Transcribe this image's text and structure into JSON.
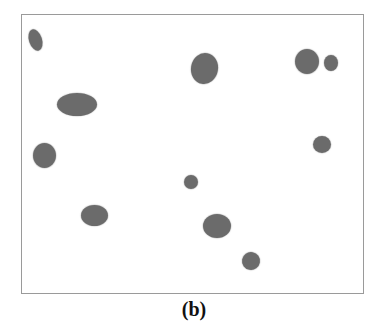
{
  "figure": {
    "caption": "(b)",
    "frame": {
      "x": 21,
      "y": 14,
      "width": 341,
      "height": 278,
      "border_color": "#9a9a9a"
    },
    "blob_color": "#6b6b6b",
    "blobs": [
      {
        "id": 1,
        "cx": 35,
        "cy": 40,
        "w": 13,
        "h": 22,
        "rotate": -18
      },
      {
        "id": 2,
        "cx": 77,
        "cy": 104,
        "w": 40,
        "h": 23,
        "rotate": 0
      },
      {
        "id": 3,
        "cx": 44,
        "cy": 155,
        "w": 23,
        "h": 25,
        "rotate": 0
      },
      {
        "id": 4,
        "cx": 94,
        "cy": 215,
        "w": 27,
        "h": 21,
        "rotate": 0
      },
      {
        "id": 5,
        "cx": 204,
        "cy": 68,
        "w": 27,
        "h": 31,
        "rotate": 10
      },
      {
        "id": 6,
        "cx": 307,
        "cy": 61,
        "w": 24,
        "h": 25,
        "rotate": 0
      },
      {
        "id": 7,
        "cx": 331,
        "cy": 63,
        "w": 14,
        "h": 16,
        "rotate": 0
      },
      {
        "id": 8,
        "cx": 322,
        "cy": 144,
        "w": 18,
        "h": 17,
        "rotate": 0
      },
      {
        "id": 9,
        "cx": 191,
        "cy": 182,
        "w": 14,
        "h": 14,
        "rotate": 0
      },
      {
        "id": 10,
        "cx": 217,
        "cy": 226,
        "w": 28,
        "h": 24,
        "rotate": 0
      },
      {
        "id": 11,
        "cx": 251,
        "cy": 261,
        "w": 18,
        "h": 18,
        "rotate": 10
      }
    ]
  }
}
